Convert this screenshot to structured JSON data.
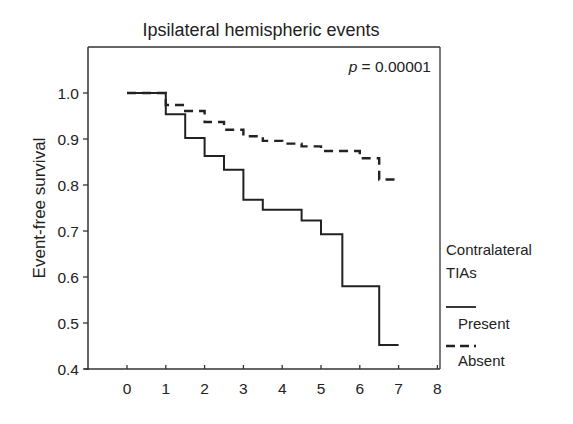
{
  "chart_data": {
    "type": "line",
    "subtype": "kaplan-meier-step",
    "title": "Ipsilateral hemispheric events",
    "xlabel": "",
    "ylabel": "Event-free survival",
    "xlim": [
      -1,
      8
    ],
    "ylim": [
      0.4,
      1.1
    ],
    "xticks": [
      0,
      1,
      2,
      3,
      4,
      5,
      6,
      7,
      8
    ],
    "yticks": [
      0.4,
      0.5,
      0.6,
      0.7,
      0.8,
      0.9,
      1.0
    ],
    "ytick_labels": [
      "0.4",
      "0.5",
      "0.6",
      "0.7",
      "0.8",
      "0.9",
      "1.0"
    ],
    "xtick_labels": [
      "0",
      "1",
      "2",
      "3",
      "4",
      "5",
      "6",
      "7",
      "8"
    ],
    "grid": false,
    "annotation": {
      "prefix": "p",
      "text": " = 0.00001"
    },
    "legend": {
      "position": "right-outside",
      "title_lines": [
        "Contralateral",
        "TIAs"
      ]
    },
    "series": [
      {
        "name": "Present",
        "style": "solid",
        "color": "#222222",
        "x": [
          0,
          1,
          1.5,
          2,
          2.5,
          3,
          3.5,
          4.5,
          5,
          5.55,
          6.5,
          7
        ],
        "y": [
          1.0,
          0.954,
          0.902,
          0.863,
          0.833,
          0.768,
          0.746,
          0.723,
          0.693,
          0.58,
          0.452,
          0.452
        ]
      },
      {
        "name": "Absent",
        "style": "dashed",
        "color": "#222222",
        "x": [
          0,
          1,
          1.5,
          2,
          2.5,
          3,
          3.5,
          4,
          4.5,
          5,
          6,
          6.5,
          7
        ],
        "y": [
          1.0,
          0.974,
          0.961,
          0.937,
          0.92,
          0.906,
          0.896,
          0.89,
          0.884,
          0.874,
          0.858,
          0.812,
          0.812
        ]
      }
    ]
  }
}
